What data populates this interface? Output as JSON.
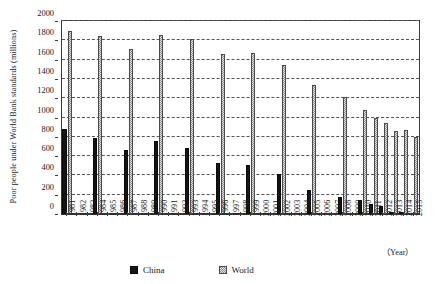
{
  "chart_data": {
    "type": "bar",
    "title": "",
    "xlabel": "（Year）",
    "ylabel": "Poor people under World Bank standards (millions)",
    "ylim": [
      0,
      2000
    ],
    "ytick_step": 200,
    "yticks": [
      0,
      200,
      400,
      600,
      800,
      1000,
      1200,
      1400,
      1600,
      1800,
      2000
    ],
    "grid": true,
    "legend_position": "bottom",
    "categories": [
      "1981",
      "1982",
      "1983",
      "1984",
      "1985",
      "1986",
      "1987",
      "1988",
      "1989",
      "1990",
      "1991",
      "1992",
      "1993",
      "1994",
      "1995",
      "1996",
      "1997",
      "1998",
      "1999",
      "2000",
      "2001",
      "2002",
      "2003",
      "2004",
      "2005",
      "2006",
      "2007",
      "2008",
      "2009",
      "2010",
      "2011",
      "2012",
      "2013",
      "2014",
      "2015"
    ],
    "series": [
      {
        "name": "China",
        "color": "#141414",
        "values": [
          878,
          null,
          null,
          789,
          null,
          null,
          661,
          null,
          null,
          756,
          null,
          null,
          689,
          null,
          null,
          533,
          null,
          null,
          509,
          null,
          null,
          413,
          null,
          null,
          244,
          null,
          null,
          173,
          null,
          150,
          108,
          87,
          25,
          22,
          null
        ]
      },
      {
        "name": "World",
        "color": "#e4e4e4",
        "values": [
          1897,
          null,
          null,
          1845,
          null,
          null,
          1714,
          null,
          null,
          1850,
          null,
          null,
          1813,
          null,
          null,
          1656,
          null,
          null,
          1664,
          null,
          null,
          1545,
          null,
          null,
          1336,
          null,
          null,
          1212,
          null,
          1073,
          990,
          940,
          856,
          866,
          800
        ]
      }
    ],
    "legend": [
      {
        "label": "China",
        "swatch": "china"
      },
      {
        "label": "World",
        "swatch": "world"
      }
    ]
  }
}
